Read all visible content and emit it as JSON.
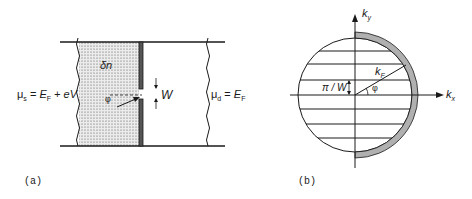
{
  "panel_a": {
    "caption": "(a)",
    "region_label": "δn",
    "width_label": "W",
    "angle_label": "φ",
    "source_label": {
      "mu": "μ",
      "sub": "s",
      "eq": " = ",
      "E": "E",
      "Esub": "F",
      "rest": " + eV"
    },
    "drain_label": {
      "mu": "μ",
      "sub": "d",
      "eq": " = ",
      "E": "E",
      "Esub": "F"
    }
  },
  "panel_b": {
    "caption": "(b)",
    "ky_label": {
      "k": "k",
      "sub": "y"
    },
    "kx_label": {
      "k": "k",
      "sub": "x"
    },
    "kf_label": {
      "k": "k",
      "sub": "F"
    },
    "spacing_label": "π / W",
    "angle_label": "φ"
  },
  "colors": {
    "line": "#1a1a1a",
    "stipple": "#d9d9d9",
    "shaded_arc": "#b0b0b0"
  }
}
